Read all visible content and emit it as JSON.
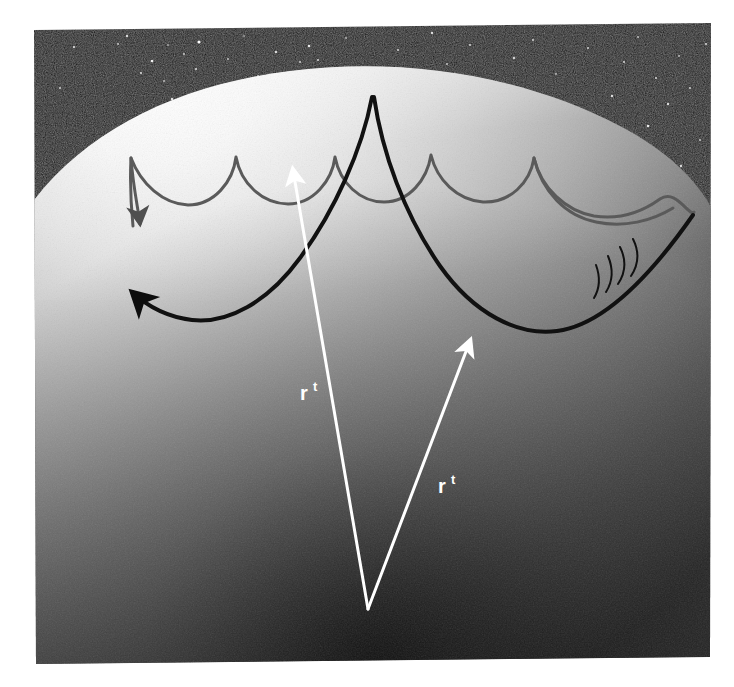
{
  "figure": {
    "domain": "Diagram",
    "caption_visible": false,
    "media": "scanned photographic print on white page"
  },
  "canvas": {
    "width": 734,
    "height": 687,
    "page_background": "#ffffff"
  },
  "photo": {
    "name": "scanned-photo-print",
    "left": 33,
    "top": 24,
    "right": 710,
    "bottom": 664,
    "rotation_deg": -0.9,
    "border": "none"
  },
  "sky": {
    "name": "star-field",
    "background": "#090909",
    "noise": "film grain",
    "stars": [
      {
        "x": 60,
        "y": 88,
        "r": 1.0,
        "b": 0.75
      },
      {
        "x": 74,
        "y": 47,
        "r": 1.1,
        "b": 0.85
      },
      {
        "x": 88,
        "y": 150,
        "r": 1.3,
        "b": 0.9
      },
      {
        "x": 106,
        "y": 140,
        "r": 0.9,
        "b": 0.6
      },
      {
        "x": 118,
        "y": 44,
        "r": 1.0,
        "b": 0.7
      },
      {
        "x": 127,
        "y": 36,
        "r": 1.2,
        "b": 0.8
      },
      {
        "x": 141,
        "y": 73,
        "r": 1.1,
        "b": 0.78
      },
      {
        "x": 149,
        "y": 122,
        "r": 1.1,
        "b": 0.72
      },
      {
        "x": 152,
        "y": 61,
        "r": 1.3,
        "b": 0.92
      },
      {
        "x": 164,
        "y": 81,
        "r": 1.0,
        "b": 0.66
      },
      {
        "x": 168,
        "y": 45,
        "r": 0.9,
        "b": 0.58
      },
      {
        "x": 172,
        "y": 99,
        "r": 1.2,
        "b": 0.84
      },
      {
        "x": 184,
        "y": 54,
        "r": 1.0,
        "b": 0.7
      },
      {
        "x": 196,
        "y": 69,
        "r": 1.1,
        "b": 0.76
      },
      {
        "x": 199,
        "y": 42,
        "r": 1.6,
        "b": 1.0
      },
      {
        "x": 214,
        "y": 118,
        "r": 1.1,
        "b": 0.74
      },
      {
        "x": 228,
        "y": 59,
        "r": 1.0,
        "b": 0.66
      },
      {
        "x": 235,
        "y": 98,
        "r": 1.2,
        "b": 0.82
      },
      {
        "x": 244,
        "y": 36,
        "r": 0.9,
        "b": 0.56
      },
      {
        "x": 258,
        "y": 76,
        "r": 1.1,
        "b": 0.72
      },
      {
        "x": 276,
        "y": 52,
        "r": 1.2,
        "b": 0.8
      },
      {
        "x": 300,
        "y": 62,
        "r": 1.1,
        "b": 0.7
      },
      {
        "x": 309,
        "y": 46,
        "r": 1.3,
        "b": 0.88
      },
      {
        "x": 318,
        "y": 60,
        "r": 1.1,
        "b": 0.74
      },
      {
        "x": 346,
        "y": 38,
        "r": 1.0,
        "b": 0.62
      },
      {
        "x": 372,
        "y": 70,
        "r": 0.9,
        "b": 0.55
      },
      {
        "x": 398,
        "y": 50,
        "r": 1.1,
        "b": 0.72
      },
      {
        "x": 432,
        "y": 33,
        "r": 1.2,
        "b": 0.8
      },
      {
        "x": 447,
        "y": 64,
        "r": 1.0,
        "b": 0.66
      },
      {
        "x": 470,
        "y": 45,
        "r": 1.1,
        "b": 0.7
      },
      {
        "x": 492,
        "y": 86,
        "r": 1.0,
        "b": 0.62
      },
      {
        "x": 514,
        "y": 58,
        "r": 1.2,
        "b": 0.78
      },
      {
        "x": 533,
        "y": 40,
        "r": 1.1,
        "b": 0.72
      },
      {
        "x": 556,
        "y": 74,
        "r": 1.0,
        "b": 0.64
      },
      {
        "x": 572,
        "y": 110,
        "r": 1.2,
        "b": 0.8
      },
      {
        "x": 588,
        "y": 48,
        "r": 1.1,
        "b": 0.7
      },
      {
        "x": 603,
        "y": 131,
        "r": 1.0,
        "b": 0.6
      },
      {
        "x": 612,
        "y": 96,
        "r": 1.2,
        "b": 0.82
      },
      {
        "x": 624,
        "y": 62,
        "r": 1.1,
        "b": 0.74
      },
      {
        "x": 638,
        "y": 37,
        "r": 1.0,
        "b": 0.64
      },
      {
        "x": 648,
        "y": 126,
        "r": 1.3,
        "b": 0.88
      },
      {
        "x": 656,
        "y": 78,
        "r": 1.1,
        "b": 0.72
      },
      {
        "x": 668,
        "y": 104,
        "r": 1.2,
        "b": 0.8
      },
      {
        "x": 679,
        "y": 56,
        "r": 1.0,
        "b": 0.62
      },
      {
        "x": 690,
        "y": 88,
        "r": 1.1,
        "b": 0.7
      },
      {
        "x": 700,
        "y": 140,
        "r": 1.0,
        "b": 0.66
      },
      {
        "x": 706,
        "y": 44,
        "r": 1.1,
        "b": 0.74
      },
      {
        "x": 681,
        "y": 166,
        "r": 1.2,
        "b": 0.8
      }
    ]
  },
  "planet": {
    "name": "planet-limb",
    "limb_highlight_color": "#ffffff",
    "mid_tone_color": "#b9b9b9",
    "shadow_color": "#3a3a3a",
    "deep_shadow_color": "#1b1b1b",
    "terminator_note": "bright limb at top-left fading to dark toward bottom-center"
  },
  "curves": {
    "gray_wavefront": {
      "name": "gray-epicycloid-curve",
      "color": "#5a5a5a",
      "stroke_width": 3,
      "cusp_count": 6,
      "arrowhead": "down-left",
      "arrow_tip": {
        "x": 133,
        "y": 232
      },
      "description": "outer scalloped wave front with six cusps along the limb"
    },
    "black_wavefront": {
      "name": "black-epicycloid-curve",
      "color": "#111111",
      "stroke_width": 4,
      "cusp_count": 1,
      "arrowhead": "up-left",
      "arrow_tip": {
        "x": 124,
        "y": 288
      },
      "tick_marks": 4,
      "description": "inner deeper scalloped wave front with a single central cusp and four hatch ticks on its right limb"
    }
  },
  "vectors": {
    "origin": {
      "x": 368,
      "y": 609
    },
    "items": [
      {
        "name": "radius-vector-left",
        "label": "r",
        "superscript": "t",
        "color": "#ffffff",
        "stroke_width": 3,
        "tip": {
          "x": 293,
          "y": 168
        },
        "label_pos": {
          "x": 300,
          "y": 398
        }
      },
      {
        "name": "radius-vector-right",
        "label": "r",
        "superscript": "t",
        "color": "#ffffff",
        "stroke_width": 3,
        "tip": {
          "x": 470,
          "y": 339
        },
        "label_pos": {
          "x": 438,
          "y": 491
        }
      }
    ]
  }
}
